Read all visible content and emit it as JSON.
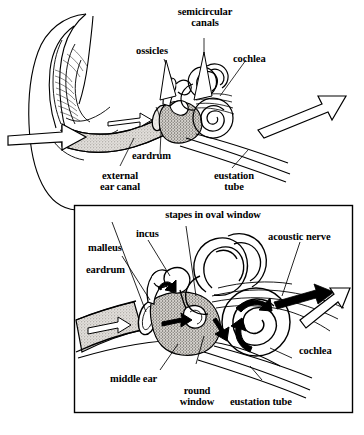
{
  "figure": {
    "panels": [
      {
        "id": "overview",
        "name": "outer-middle-inner-ear-overview",
        "labels": [
          {
            "key": "semicircular_canals",
            "text": "semicircular\ncanals"
          },
          {
            "key": "ossicles",
            "text": "ossicles"
          },
          {
            "key": "cochlea",
            "text": "cochlea"
          },
          {
            "key": "eardrum",
            "text": "eardrum"
          },
          {
            "key": "external_ear_canal",
            "text": "external\near canal"
          },
          {
            "key": "eustation_tube",
            "text": "eustation\ntube"
          }
        ]
      },
      {
        "id": "detail",
        "name": "middle-inner-ear-detail",
        "labels": [
          {
            "key": "stapes_in_oval_window",
            "text": "stapes in oval window"
          },
          {
            "key": "incus",
            "text": "incus"
          },
          {
            "key": "malleus",
            "text": "malleus"
          },
          {
            "key": "eardrum",
            "text": "eardrum"
          },
          {
            "key": "acoustic_nerve",
            "text": "acoustic nerve"
          },
          {
            "key": "cochlea",
            "text": "cochlea"
          },
          {
            "key": "middle_ear",
            "text": "middle ear"
          },
          {
            "key": "round_window",
            "text": "round\nwindow"
          },
          {
            "key": "eustation_tube",
            "text": "eustation tube"
          }
        ]
      }
    ]
  },
  "overview": {
    "semicircular_canals_line1": "semicircular",
    "semicircular_canals_line2": "canals",
    "ossicles": "ossicles",
    "cochlea": "cochlea",
    "eardrum": "eardrum",
    "external_line1": "external",
    "external_line2": "ear canal",
    "eustation_line1": "eustation",
    "eustation_line2": "tube"
  },
  "detail": {
    "stapes": "stapes in oval window",
    "incus": "incus",
    "malleus": "malleus",
    "eardrum": "eardrum",
    "acoustic_nerve": "acoustic nerve",
    "cochlea": "cochlea",
    "middle_ear": "middle ear",
    "round_window_line1": "round",
    "round_window_line2": "window",
    "eustation_tube": "eustation tube"
  },
  "style": {
    "ink": "#000000",
    "paper": "#ffffff",
    "shade_fill": "#c9c6c2",
    "canal_fill": "#d8d5d1"
  }
}
